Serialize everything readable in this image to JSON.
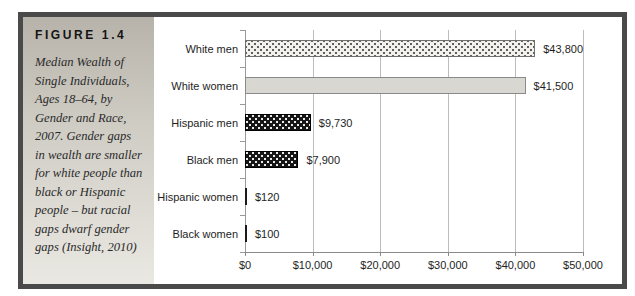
{
  "figure": {
    "label": "FIGURE 1.4",
    "caption": "Median Wealth of Single Individuals, Ages 18–64, by Gender and Race, 2007. Gender gaps in wealth are smaller for white people than black or Hispanic people – but racial gaps dwarf gender gaps (Insight, 2010)"
  },
  "chart_data": {
    "type": "bar",
    "orientation": "horizontal",
    "title": "Median Wealth of Single Individuals, Ages 18–64, by Gender and Race, 2007",
    "categories": [
      "White men",
      "White women",
      "Hispanic men",
      "Black men",
      "Hispanic women",
      "Black women"
    ],
    "values": [
      43800,
      41500,
      9730,
      7900,
      120,
      100
    ],
    "value_labels": [
      "$43,800",
      "$41,500",
      "$9,730",
      "$7,900",
      "$120",
      "$100"
    ],
    "bar_styles": [
      "light-dots",
      "solid-light",
      "dark-dots",
      "dark-dots",
      "solid-dark",
      "solid-dark"
    ],
    "x_ticks": [
      "$0",
      "$10,000",
      "$20,000",
      "$30,000",
      "$40,000",
      "$50,000"
    ],
    "xlim": [
      0,
      50000
    ],
    "grid": true,
    "legend": false,
    "xlabel": "",
    "ylabel": ""
  },
  "colors": {
    "frame_border": "#4a4a4a",
    "sidebar_top": "#b7b3aa",
    "sidebar_bottom": "#eae8e2",
    "gridline": "#bcbcbc",
    "bar_dark": "#161616",
    "bar_light_gray": "#d9d7d2",
    "bar_dotted_light": "#f3f1ed",
    "text": "#1e1e1e"
  }
}
